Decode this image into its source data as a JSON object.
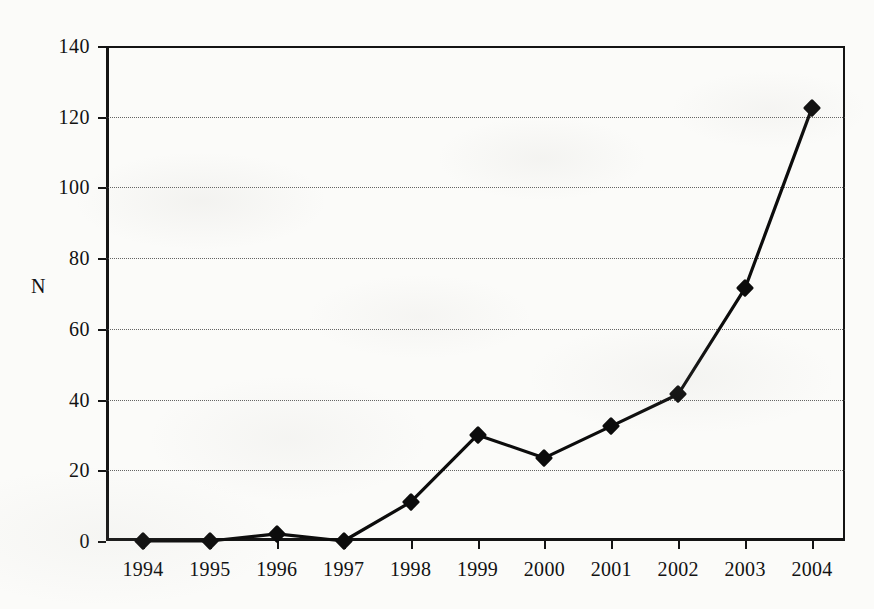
{
  "chart_data": {
    "type": "line",
    "title": "",
    "xlabel": "",
    "ylabel": "N",
    "categories": [
      "1994",
      "1995",
      "1996",
      "1997",
      "1998",
      "1999",
      "2000",
      "2001",
      "2002",
      "2003",
      "2004"
    ],
    "values": [
      0,
      0,
      2,
      0,
      11,
      30,
      23.5,
      32.5,
      41.5,
      71.5,
      122.5
    ],
    "series": [
      {
        "name": "N",
        "values": [
          0,
          0,
          2,
          0,
          11,
          30,
          23.5,
          32.5,
          41.5,
          71.5,
          122.5
        ]
      }
    ],
    "ylim": [
      0,
      140
    ],
    "yticks": [
      0,
      20,
      40,
      60,
      80,
      100,
      120,
      140
    ],
    "ytick_labels": [
      "0",
      "20",
      "40",
      "60",
      "80",
      "100",
      "120",
      "140"
    ],
    "grid": true,
    "grid_axis": "y",
    "grid_style": "dotted",
    "legend": false,
    "legend_position": "none",
    "marker": "diamond",
    "line_color": "#0c0c0c",
    "marker_color": "#0c0c0c",
    "background_color": "#fbfbf9",
    "axis_color": "#141414"
  }
}
